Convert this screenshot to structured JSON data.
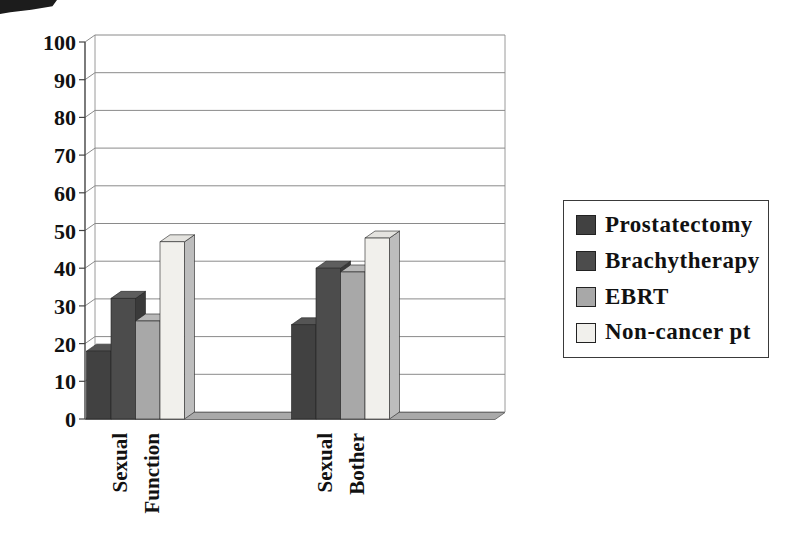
{
  "page": {
    "background": "#ffffff",
    "title": ""
  },
  "chart_data": {
    "type": "bar",
    "style": "3d-clustered-column",
    "title": "",
    "xlabel": "",
    "ylabel": "",
    "categories": [
      "Sexual Function",
      "Sexual Bother"
    ],
    "series": [
      {
        "name": "Prostatectomy",
        "values": [
          18,
          25
        ],
        "color": "#414141",
        "color_top": "#555555",
        "color_side": "#303030"
      },
      {
        "name": "Brachytherapy",
        "values": [
          32,
          40
        ],
        "color": "#4c4c4c",
        "color_top": "#5e5e5e",
        "color_side": "#3a3a3a"
      },
      {
        "name": "EBRT",
        "values": [
          26,
          39
        ],
        "color": "#a8a8a8",
        "color_top": "#b8b8b8",
        "color_side": "#8f8f8f"
      },
      {
        "name": "Non-cancer pt",
        "values": [
          47,
          48
        ],
        "color": "#f1f0ec",
        "color_top": "#e4e3df",
        "color_side": "#bdbdbd"
      }
    ],
    "ylim": [
      0,
      100
    ],
    "ytick_step": 10,
    "ytick_labels": [
      "0",
      "10",
      "20",
      "30",
      "40",
      "50",
      "60",
      "70",
      "80",
      "90",
      "100"
    ],
    "grid": true,
    "legend_position": "right",
    "axis_color": "#444444",
    "gridline_color": "#8a8a8a",
    "floor_color": "#a9a9a9",
    "wall_edge_color": "#9a9a9a",
    "text_color": "#111111"
  }
}
